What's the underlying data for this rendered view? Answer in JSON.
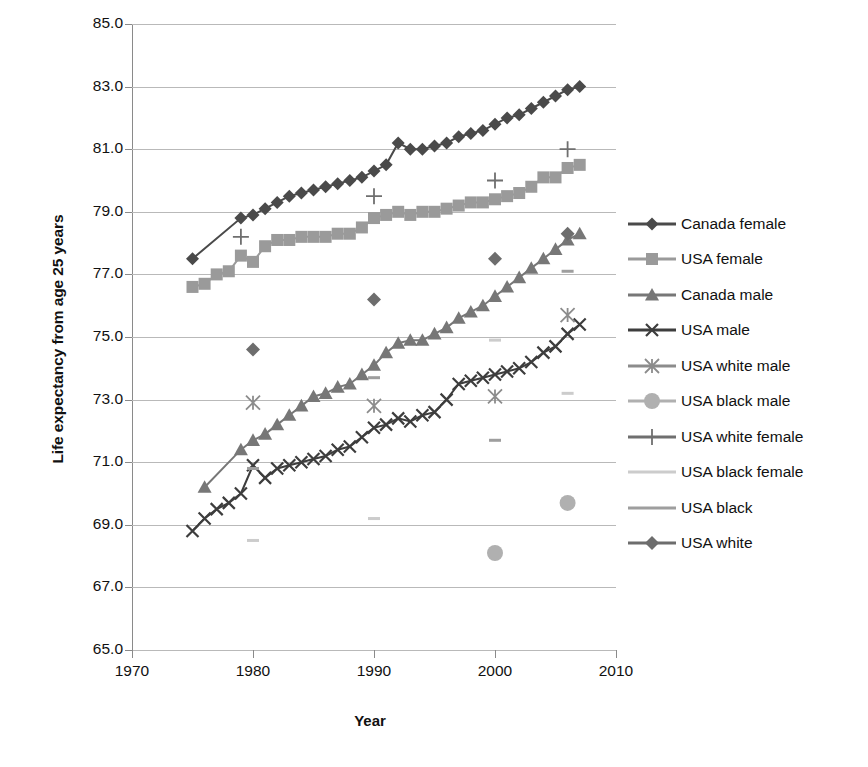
{
  "chart_data": {
    "type": "line",
    "title": "",
    "xlabel": "Year",
    "ylabel": "Life expectancy from age 25 years",
    "xlim": [
      1970,
      2010
    ],
    "ylim": [
      65.0,
      85.0
    ],
    "xticks": [
      "1970",
      "1980",
      "1990",
      "2000",
      "2010"
    ],
    "yticks": [
      "65.0",
      "67.0",
      "69.0",
      "71.0",
      "73.0",
      "75.0",
      "77.0",
      "79.0",
      "81.0",
      "83.0",
      "85.0"
    ],
    "grid": true,
    "legend_position": "right",
    "series": [
      {
        "name": "Canada female",
        "marker": "diamond",
        "color": "#4a4a4a",
        "style": "line",
        "x": [
          1975,
          1979,
          1980,
          1981,
          1982,
          1983,
          1984,
          1985,
          1986,
          1987,
          1988,
          1989,
          1990,
          1991,
          1992,
          1993,
          1994,
          1995,
          1996,
          1997,
          1998,
          1999,
          2000,
          2001,
          2002,
          2003,
          2004,
          2005,
          2006,
          2007
        ],
        "y": [
          77.5,
          78.8,
          78.9,
          79.1,
          79.3,
          79.5,
          79.6,
          79.7,
          79.8,
          79.9,
          80.0,
          80.1,
          80.3,
          80.5,
          81.2,
          81.0,
          81.0,
          81.1,
          81.2,
          81.4,
          81.5,
          81.6,
          81.8,
          82.0,
          82.1,
          82.3,
          82.5,
          82.7,
          82.9,
          83.0
        ]
      },
      {
        "name": "USA female",
        "marker": "square",
        "color": "#9a9a9a",
        "style": "line",
        "x": [
          1975,
          1976,
          1977,
          1978,
          1979,
          1980,
          1981,
          1982,
          1983,
          1984,
          1985,
          1986,
          1987,
          1988,
          1989,
          1990,
          1991,
          1992,
          1993,
          1994,
          1995,
          1996,
          1997,
          1998,
          1999,
          2000,
          2001,
          2002,
          2003,
          2004,
          2005,
          2006,
          2007
        ],
        "y": [
          76.6,
          76.7,
          77.0,
          77.1,
          77.6,
          77.4,
          77.9,
          78.1,
          78.1,
          78.2,
          78.2,
          78.2,
          78.3,
          78.3,
          78.5,
          78.8,
          78.9,
          79.0,
          78.9,
          79.0,
          79.0,
          79.1,
          79.2,
          79.3,
          79.3,
          79.4,
          79.5,
          79.6,
          79.8,
          80.1,
          80.1,
          80.4,
          80.5
        ]
      },
      {
        "name": "Canada male",
        "marker": "triangle",
        "color": "#777777",
        "style": "line",
        "x": [
          1976,
          1979,
          1980,
          1981,
          1982,
          1983,
          1984,
          1985,
          1986,
          1987,
          1988,
          1989,
          1990,
          1991,
          1992,
          1993,
          1994,
          1995,
          1996,
          1997,
          1998,
          1999,
          2000,
          2001,
          2002,
          2003,
          2004,
          2005,
          2006,
          2007
        ],
        "y": [
          70.2,
          71.4,
          71.7,
          71.9,
          72.2,
          72.5,
          72.8,
          73.1,
          73.2,
          73.4,
          73.5,
          73.8,
          74.1,
          74.5,
          74.8,
          74.9,
          74.9,
          75.1,
          75.3,
          75.6,
          75.8,
          76.0,
          76.3,
          76.6,
          76.9,
          77.2,
          77.5,
          77.8,
          78.1,
          78.3
        ]
      },
      {
        "name": "USA male",
        "marker": "x",
        "color": "#3d3d3d",
        "style": "line",
        "x": [
          1975,
          1976,
          1977,
          1978,
          1979,
          1980,
          1981,
          1982,
          1983,
          1984,
          1985,
          1986,
          1987,
          1988,
          1989,
          1990,
          1991,
          1992,
          1993,
          1994,
          1995,
          1996,
          1997,
          1998,
          1999,
          2000,
          2001,
          2002,
          2003,
          2004,
          2005,
          2006,
          2007
        ],
        "y": [
          68.8,
          69.2,
          69.5,
          69.7,
          70.0,
          70.9,
          70.5,
          70.8,
          70.9,
          71.0,
          71.1,
          71.2,
          71.4,
          71.5,
          71.8,
          72.1,
          72.2,
          72.4,
          72.3,
          72.5,
          72.6,
          73.0,
          73.5,
          73.6,
          73.7,
          73.8,
          73.9,
          74.0,
          74.2,
          74.5,
          74.7,
          75.1,
          75.4
        ]
      },
      {
        "name": "USA white male",
        "marker": "asterisk",
        "color": "#8c8c8c",
        "style": "scatter",
        "x": [
          1980,
          1990,
          2000,
          2006
        ],
        "y": [
          72.9,
          72.8,
          73.1,
          75.7
        ]
      },
      {
        "name": "USA black male",
        "marker": "circle",
        "color": "#b0b0b0",
        "style": "scatter",
        "x": [
          2000,
          2006
        ],
        "y": [
          68.1,
          69.7
        ]
      },
      {
        "name": "USA white female",
        "marker": "plus",
        "color": "#6f6f6f",
        "style": "scatter",
        "x": [
          1979,
          1990,
          2000,
          2006
        ],
        "y": [
          78.2,
          79.5,
          80.0,
          81.0
        ]
      },
      {
        "name": "USA black female",
        "marker": "dash-light",
        "color": "#cccccc",
        "style": "scatter",
        "x": [
          1980,
          1990,
          2000,
          2006
        ],
        "y": [
          68.5,
          69.2,
          74.9,
          73.2
        ]
      },
      {
        "name": "USA black",
        "marker": "dash",
        "color": "#9e9e9e",
        "style": "scatter",
        "x": [
          1980,
          1990,
          2000,
          2006
        ],
        "y": [
          70.8,
          73.7,
          71.7,
          77.1
        ]
      },
      {
        "name": "USA white",
        "marker": "diamond-small",
        "color": "#6d6d6d",
        "style": "scatter",
        "x": [
          1980,
          1990,
          2000,
          2006
        ],
        "y": [
          74.6,
          76.2,
          77.5,
          78.3
        ]
      }
    ]
  },
  "axes": {
    "y_title": "Life expectancy from age 25 years",
    "x_title": "Year"
  },
  "legend": {
    "items": [
      {
        "label": "Canada female"
      },
      {
        "label": "USA female"
      },
      {
        "label": "Canada male"
      },
      {
        "label": "USA male"
      },
      {
        "label": "USA white male"
      },
      {
        "label": "USA black male"
      },
      {
        "label": "USA white female"
      },
      {
        "label": "USA black female"
      },
      {
        "label": "USA black"
      },
      {
        "label": "USA white"
      }
    ]
  }
}
